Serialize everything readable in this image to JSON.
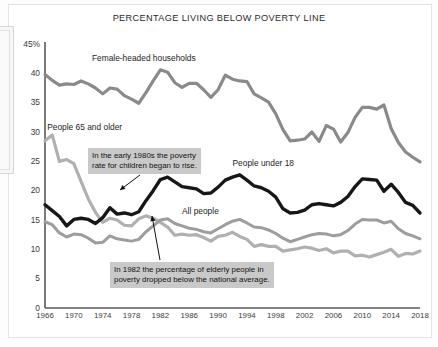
{
  "chart_data": {
    "type": "line",
    "title": "PERCENTAGE LIVING BELOW POVERTY LINE",
    "xlabel": "",
    "ylabel": "",
    "xlim": [
      1966,
      2018
    ],
    "ylim": [
      0,
      45
    ],
    "grid": false,
    "legend_position": "inline-labels",
    "y_ticks": [
      "0",
      "5",
      "10",
      "15",
      "20",
      "25",
      "30",
      "35",
      "40",
      "45%"
    ],
    "y_tick_values": [
      0,
      5,
      10,
      15,
      20,
      25,
      30,
      35,
      40,
      45
    ],
    "x_ticks": [
      "1966",
      "1970",
      "1974",
      "1978",
      "1982",
      "1986",
      "1990",
      "1994",
      "1998",
      "2002",
      "2006",
      "2010",
      "2014",
      "2018"
    ],
    "x_tick_values": [
      1966,
      1970,
      1974,
      1978,
      1982,
      1986,
      1990,
      1994,
      1998,
      2002,
      2006,
      2010,
      2014,
      2018
    ],
    "x": [
      1966,
      1967,
      1968,
      1969,
      1970,
      1971,
      1972,
      1973,
      1974,
      1975,
      1976,
      1977,
      1978,
      1979,
      1980,
      1981,
      1982,
      1983,
      1984,
      1985,
      1986,
      1987,
      1988,
      1989,
      1990,
      1991,
      1992,
      1993,
      1994,
      1995,
      1996,
      1997,
      1998,
      1999,
      2000,
      2001,
      2002,
      2003,
      2004,
      2005,
      2006,
      2007,
      2008,
      2009,
      2010,
      2011,
      2012,
      2013,
      2014,
      2015,
      2016,
      2017,
      2018
    ],
    "series": [
      {
        "name": "Female-headed households",
        "color": "#8a8a8a",
        "width": 3.2,
        "label_x": 1972.5,
        "label_y": 42.4,
        "values": [
          39.8,
          38.8,
          38.0,
          38.2,
          38.1,
          38.7,
          38.2,
          37.5,
          36.5,
          37.5,
          37.3,
          36.2,
          35.6,
          34.9,
          36.7,
          38.7,
          40.6,
          40.2,
          38.4,
          37.6,
          38.3,
          38.3,
          37.2,
          35.9,
          37.2,
          39.7,
          39.0,
          38.7,
          38.6,
          36.5,
          35.8,
          35.1,
          33.1,
          30.4,
          28.5,
          28.6,
          28.8,
          30.0,
          28.4,
          31.1,
          30.5,
          28.3,
          29.9,
          32.5,
          34.2,
          34.2,
          33.9,
          34.6,
          30.6,
          28.2,
          26.6,
          25.7,
          24.9
        ]
      },
      {
        "name": "People 65 and older",
        "color": "#b0b0b0",
        "width": 3.2,
        "label_x": 1966.3,
        "label_y": 30.6,
        "values": [
          28.5,
          29.5,
          25.0,
          25.3,
          24.6,
          21.6,
          18.6,
          16.3,
          14.6,
          15.3,
          15.0,
          14.1,
          14.0,
          15.2,
          15.7,
          15.3,
          14.6,
          13.8,
          12.4,
          12.6,
          12.4,
          12.5,
          12.0,
          11.4,
          12.2,
          12.4,
          12.9,
          12.2,
          11.7,
          10.5,
          10.8,
          10.5,
          10.5,
          9.7,
          9.9,
          10.1,
          10.4,
          10.2,
          9.8,
          10.1,
          9.4,
          9.7,
          9.7,
          8.9,
          9.0,
          8.7,
          9.1,
          9.5,
          10.0,
          8.8,
          9.3,
          9.2,
          9.7
        ]
      },
      {
        "name": "People under 18",
        "color": "#171717",
        "width": 3.4,
        "label_x": 1992.0,
        "label_y": 24.6,
        "values": [
          17.6,
          16.6,
          15.6,
          14.0,
          15.1,
          15.3,
          15.1,
          14.4,
          15.4,
          17.1,
          16.0,
          16.2,
          15.9,
          16.4,
          18.3,
          20.0,
          21.9,
          22.3,
          21.5,
          20.7,
          20.5,
          20.3,
          19.5,
          19.6,
          20.6,
          21.8,
          22.3,
          22.7,
          21.8,
          20.8,
          20.5,
          19.9,
          18.9,
          16.9,
          16.2,
          16.3,
          16.7,
          17.6,
          17.8,
          17.6,
          17.4,
          18.0,
          19.0,
          20.7,
          22.0,
          21.9,
          21.8,
          19.9,
          21.1,
          19.7,
          18.0,
          17.5,
          16.2
        ]
      },
      {
        "name": "All people",
        "color": "#9d9d9d",
        "width": 3.0,
        "label_x": 1985.0,
        "label_y": 16.4,
        "values": [
          14.7,
          14.2,
          12.8,
          12.1,
          12.6,
          12.5,
          11.9,
          11.1,
          11.2,
          12.3,
          11.8,
          11.6,
          11.4,
          11.7,
          13.0,
          14.0,
          15.0,
          15.2,
          14.4,
          14.0,
          13.6,
          13.4,
          13.0,
          12.8,
          13.5,
          14.2,
          14.8,
          15.1,
          14.5,
          13.8,
          13.7,
          13.3,
          12.7,
          11.9,
          11.3,
          11.7,
          12.1,
          12.5,
          12.7,
          12.6,
          12.3,
          12.5,
          13.2,
          14.3,
          15.1,
          15.0,
          15.0,
          14.5,
          14.8,
          13.5,
          12.7,
          12.3,
          11.8
        ]
      }
    ],
    "annotations": [
      {
        "id": "children-rise",
        "text": "In the early 1980s the poverty\nrate for children began to rise.",
        "box_x": 88,
        "box_y": 148,
        "arrow_from_x": 140,
        "arrow_from_y": 175,
        "arrow_to_x": 120,
        "arrow_to_y": 190
      },
      {
        "id": "elderly-below-average",
        "text": "In 1982 the percentage of elderly people in\npoverty dropped below the national average.",
        "box_x": 110,
        "box_y": 262,
        "arrow_from_x": 160,
        "arrow_from_y": 260,
        "arrow_to_x": 152,
        "arrow_to_y": 216
      }
    ]
  }
}
